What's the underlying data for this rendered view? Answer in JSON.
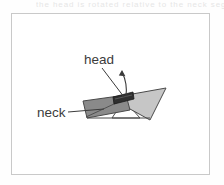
{
  "figure": {
    "caption_ghost": "the head is rotated relative to the neck segment",
    "labels": [
      {
        "id": "head",
        "text": "head"
      },
      {
        "id": "neck",
        "text": "neck"
      }
    ],
    "shapes": [
      {
        "id": "neck-quad",
        "name": "neck-quadrilateral",
        "fill": "#8a8a8a",
        "stroke": "#4a4a4a"
      },
      {
        "id": "head-triangle",
        "name": "head-triangle",
        "fill": "#c6c6c6",
        "stroke": "#4a4a4a"
      },
      {
        "id": "head-bar",
        "name": "head-bar",
        "fill": "#2f2f2f",
        "stroke": "#1a1a1a"
      },
      {
        "id": "base-wedge",
        "name": "base-wedge",
        "fill": "#ffffff",
        "stroke": "#4a4a4a"
      }
    ],
    "annotations": [
      {
        "id": "rotation-arrow",
        "name": "rotation-arrow",
        "stroke": "#3b3b3b"
      },
      {
        "id": "head-leader",
        "name": "head-leader-line",
        "stroke": "#3b3b3b"
      },
      {
        "id": "neck-leader",
        "name": "neck-leader-line",
        "stroke": "#3b3b3b"
      }
    ],
    "colors": {
      "frame": "#c9c9c9",
      "ink": "#3b3b3b",
      "page": "#ffffff",
      "dark_fill": "#8a8a8a",
      "light_fill": "#c6c6c6",
      "bar_fill": "#2f2f2f"
    }
  }
}
